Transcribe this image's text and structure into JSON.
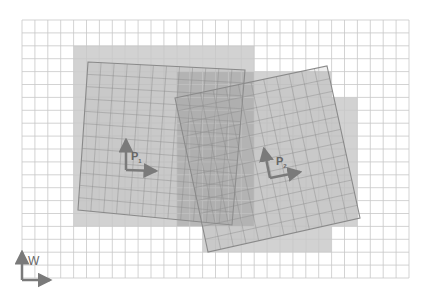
{
  "diagram": {
    "world_frame": {
      "label": "W",
      "x0": 22,
      "y0": 20,
      "cols": 30,
      "rows": 20,
      "cell": 12.9
    },
    "frames": [
      {
        "label": "P1",
        "label_main": "P",
        "label_sub": "1",
        "corners": [
          [
            88,
            62
          ],
          [
            245,
            70
          ],
          [
            232,
            225
          ],
          [
            78,
            210
          ]
        ],
        "origin": [
          126,
          170
        ]
      },
      {
        "label": "P2",
        "label_main": "P",
        "label_sub": "2",
        "corners": [
          [
            175,
            98
          ],
          [
            327,
            66
          ],
          [
            360,
            218
          ],
          [
            208,
            252
          ]
        ],
        "origin": [
          270,
          178
        ]
      }
    ],
    "colors": {
      "grid": "#c8c8c8",
      "cell_fill": "#d2d2d2",
      "overlap_fill": "#b8b8b8",
      "frame_line": "#8a8a8a",
      "arrow": "#7a7a7a"
    }
  }
}
